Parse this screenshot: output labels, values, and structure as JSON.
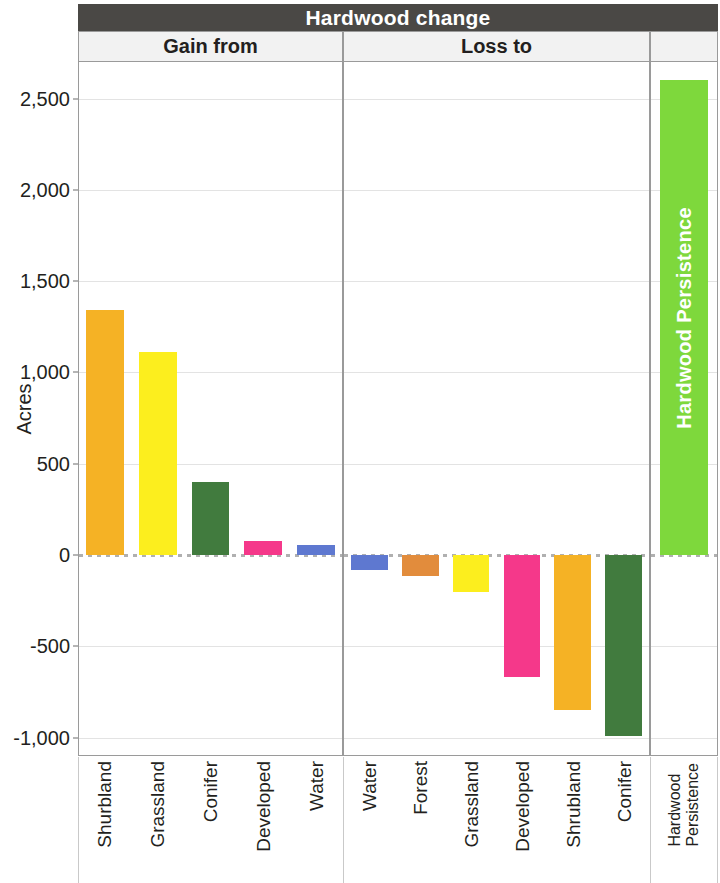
{
  "title": "Hardwood change",
  "strips": {
    "gain": "Gain from",
    "loss": "Loss to",
    "persistence": ""
  },
  "axis": {
    "y_title": "Acres",
    "y_ticks": [
      "2,500",
      "2,000",
      "1,500",
      "1,000",
      "500",
      "0",
      "-500",
      "-1,000"
    ]
  },
  "persistence_bar_label": "Hardwood Persistence",
  "persistence_x_label_line1": "Hardwood",
  "persistence_x_label_line2": "Persistence",
  "colors": {
    "header": "#4a4845",
    "strip": "#f2f2f2",
    "shrubland": "#f5b225",
    "grassland": "#fcee1e",
    "conifer": "#417b3e",
    "developed": "#f5388a",
    "water": "#5e78d0",
    "forest": "#e28c3c",
    "persistence": "#7ed83c",
    "gridline": "#e3e3e3",
    "zeroline": "#b0b0b0"
  },
  "chart_data": {
    "type": "bar",
    "title": "Hardwood change",
    "xlabel": "",
    "ylabel": "Acres",
    "ylim": [
      -1100,
      2700
    ],
    "yticks": [
      -1000,
      -500,
      0,
      500,
      1000,
      1500,
      2000,
      2500
    ],
    "grid": true,
    "legend": "none",
    "panels": [
      {
        "name": "Gain from",
        "categories": [
          "Shurbland",
          "Grassland",
          "Conifer",
          "Developed",
          "Water"
        ],
        "values": [
          1340,
          1110,
          400,
          75,
          55
        ],
        "colors": [
          "#f5b225",
          "#fcee1e",
          "#417b3e",
          "#f5388a",
          "#5e78d0"
        ]
      },
      {
        "name": "Loss to",
        "categories": [
          "Water",
          "Forest",
          "Grassland",
          "Developed",
          "Shrubland",
          "Conifer"
        ],
        "values": [
          -80,
          -115,
          -200,
          -665,
          -850,
          -990
        ],
        "colors": [
          "#5e78d0",
          "#e28c3c",
          "#fcee1e",
          "#f5388a",
          "#f5b225",
          "#417b3e"
        ]
      },
      {
        "name": "Hardwood Persistence",
        "categories": [
          "Hardwood Persistence"
        ],
        "values": [
          2600
        ],
        "colors": [
          "#7ed83c"
        ]
      }
    ]
  }
}
